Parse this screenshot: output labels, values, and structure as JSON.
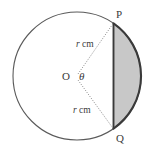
{
  "figure": {
    "name": "circle-sector-segment-diagram",
    "background_color": "#ffffff",
    "stroke_color": "#4a4a4a",
    "minor_arc_color": "#3a3a3a",
    "shade_color": "#c8c8c8",
    "dot_color": "#8a8a8a",
    "geometry": {
      "center_x": 77,
      "center_y": 76,
      "radius": 64,
      "chord_x": 113.5,
      "point_p_x": 113.5,
      "point_p_y": 23,
      "point_q_x": 113.5,
      "point_q_y": 129
    },
    "labels": {
      "point_p": "P",
      "point_q": "Q",
      "center": "O",
      "angle": "θ",
      "radius_upper_value": "r",
      "radius_upper_unit": "cm",
      "radius_lower_value": "r",
      "radius_lower_unit": "cm"
    }
  }
}
